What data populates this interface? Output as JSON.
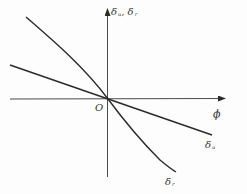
{
  "figure": {
    "type": "function-curves-diagram",
    "axes": {
      "x_label": "ϕ",
      "y_label_main": "δ",
      "y_label_sub1": "u",
      "y_label_sep": ", δ",
      "y_label_sub2": "r",
      "origin_label": "O"
    },
    "curves": [
      {
        "id": "delta_u",
        "label_main": "δ",
        "label_sub": "u",
        "shape": "straight line through origin, negative slope (shallow)"
      },
      {
        "id": "delta_r",
        "label_main": "δ",
        "label_sub": "r",
        "shape": "curve through origin, negative slope (steep), slightly curved"
      }
    ],
    "colors": {
      "line": "#2a2a2a",
      "axis": "#4a4a4a",
      "text": "#333333",
      "background": "#fdfdfd"
    }
  }
}
